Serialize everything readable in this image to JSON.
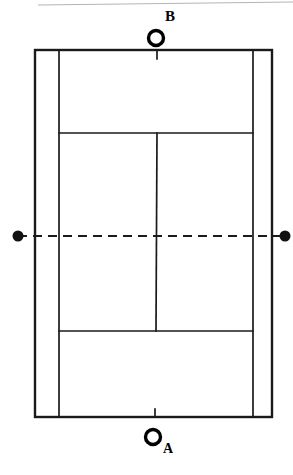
{
  "figure": {
    "background_color": "#ffffff",
    "line_color": "#1a1a1a",
    "header_rule_color": "#b4b4b4",
    "width": 293,
    "height": 475
  },
  "court": {
    "name": "tennis-court",
    "outer_left": 35,
    "outer_right": 272,
    "outer_top": 50,
    "outer_bottom": 417,
    "singles_left": 59,
    "singles_right": 253,
    "service_line_top": 133,
    "service_line_bottom": 331,
    "center_service_line_x": 157,
    "net_y": 236,
    "line_width": 2.2,
    "inner_line_width": 1.5
  },
  "net": {
    "name": "net-line",
    "style": "dashed",
    "dash_length": 9,
    "gap_length": 6,
    "left_x": 18,
    "right_x": 285,
    "y": 236,
    "post_radius": 5.5
  },
  "players": [
    {
      "id": "player-b",
      "label": "B",
      "label_position": "superscript",
      "marker": "open-circle",
      "circle_cx": 156,
      "circle_cy": 38,
      "circle_r": 7.5,
      "circle_stroke_width": 3.4,
      "side": "far"
    },
    {
      "id": "player-a",
      "label": "A",
      "label_position": "subscript",
      "marker": "open-circle",
      "circle_cx": 153,
      "circle_cy": 437,
      "circle_r": 7.5,
      "circle_stroke_width": 3.4,
      "side": "near"
    }
  ],
  "header_rule": {
    "name": "page-header-rule",
    "x1": 38,
    "y1": 5,
    "x2": 293,
    "y2": 2
  },
  "center_marks": [
    {
      "name": "center-mark-top",
      "x": 157,
      "y1": 50,
      "y2": 59
    },
    {
      "name": "center-mark-bottom",
      "x": 155,
      "y1": 409,
      "y2": 417
    }
  ]
}
